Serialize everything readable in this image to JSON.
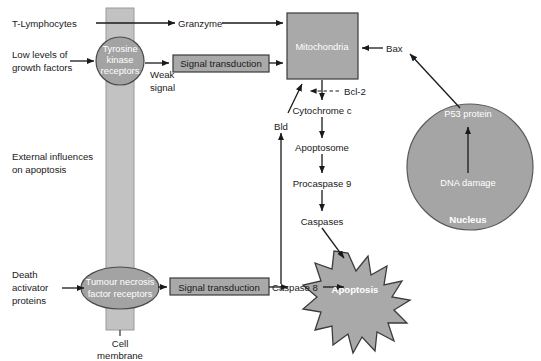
{
  "diagram": {
    "colors": {
      "shape_fill": "#a9a9a9",
      "membrane_fill": "#c2c2c2",
      "stroke": "#1a1a1a",
      "label_white": "#ffffff",
      "background": "#ffffff"
    },
    "inputs": {
      "t_lymphocytes": "T-Lymphocytes",
      "low_growth_factors_line1": "Low levels of",
      "low_growth_factors_line2": "growth factors",
      "external_influences_line1": "External influences",
      "external_influences_line2": "on apoptosis",
      "death_activator_line1": "Death",
      "death_activator_line2": "activator",
      "death_activator_line3": "proteins"
    },
    "membrane": {
      "label_line1": "Cell",
      "label_line2": "membrane"
    },
    "receptors": {
      "tyrosine_line1": "Tyrosine",
      "tyrosine_line2": "kinase",
      "tyrosine_line3": "receptors",
      "tnf_line1": "Tumour necrosis",
      "tnf_line2": "factor receptors"
    },
    "signal_boxes": {
      "top": "Signal transduction",
      "bottom": "Signal transduction"
    },
    "weak_signal": {
      "line1": "Weak",
      "line2": "signal"
    },
    "nodes": {
      "granzyme": "Granzyme",
      "mitochondria": "Mitochondria",
      "bax": "Bax",
      "bcl2": "Bcl-2",
      "cytochrome_c": "Cytochrome c",
      "bid": "Bld",
      "apoptosome": "Apoptosome",
      "procaspase9": "Procaspase 9",
      "caspases": "Caspases",
      "caspase8": "Caspase 8",
      "apoptosis": "Apoptosis"
    },
    "nucleus": {
      "p53": "P53 protein",
      "dna_damage": "DNA damage",
      "label": "Nucleus"
    }
  }
}
